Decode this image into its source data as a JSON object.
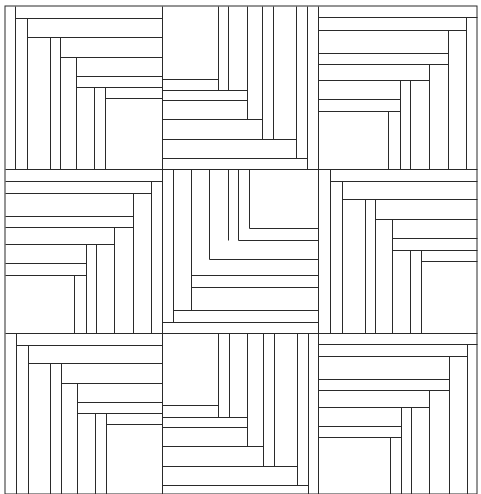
{
  "diagram": {
    "title": "",
    "stroke_color": "#2a2a2a",
    "background_color": "#ffffff",
    "stroke_width": 1,
    "outer_frame": {
      "x": 5,
      "y": 6,
      "w": 472,
      "h": 488
    },
    "block_grid": {
      "cols_x": [
        5,
        162,
        318,
        477
      ],
      "rows_y": [
        6,
        169,
        333,
        494
      ]
    },
    "lines": [
      {
        "x1": 162,
        "y1": 6,
        "x2": 162,
        "y2": 494
      },
      {
        "x1": 318,
        "y1": 6,
        "x2": 318,
        "y2": 494
      },
      {
        "x1": 5,
        "y1": 169,
        "x2": 477,
        "y2": 169
      },
      {
        "x1": 5,
        "y1": 333,
        "x2": 477,
        "y2": 333
      },
      {
        "x1": 15,
        "y1": 6,
        "x2": 15,
        "y2": 169
      },
      {
        "x1": 15,
        "y1": 18,
        "x2": 162,
        "y2": 18
      },
      {
        "x1": 27,
        "y1": 18,
        "x2": 27,
        "y2": 169
      },
      {
        "x1": 27,
        "y1": 37,
        "x2": 162,
        "y2": 37
      },
      {
        "x1": 50,
        "y1": 37,
        "x2": 50,
        "y2": 169
      },
      {
        "x1": 60,
        "y1": 37,
        "x2": 60,
        "y2": 169
      },
      {
        "x1": 60,
        "y1": 57,
        "x2": 162,
        "y2": 57
      },
      {
        "x1": 76,
        "y1": 57,
        "x2": 76,
        "y2": 169
      },
      {
        "x1": 76,
        "y1": 76,
        "x2": 162,
        "y2": 76
      },
      {
        "x1": 76,
        "y1": 87,
        "x2": 162,
        "y2": 87
      },
      {
        "x1": 94,
        "y1": 87,
        "x2": 94,
        "y2": 169
      },
      {
        "x1": 105,
        "y1": 87,
        "x2": 105,
        "y2": 169
      },
      {
        "x1": 105,
        "y1": 98,
        "x2": 162,
        "y2": 98
      },
      {
        "x1": 218,
        "y1": 6,
        "x2": 218,
        "y2": 90
      },
      {
        "x1": 162,
        "y1": 79,
        "x2": 218,
        "y2": 79
      },
      {
        "x1": 228,
        "y1": 6,
        "x2": 228,
        "y2": 90
      },
      {
        "x1": 162,
        "y1": 90,
        "x2": 247,
        "y2": 90
      },
      {
        "x1": 162,
        "y1": 100,
        "x2": 247,
        "y2": 100
      },
      {
        "x1": 247,
        "y1": 6,
        "x2": 247,
        "y2": 119
      },
      {
        "x1": 162,
        "y1": 119,
        "x2": 262,
        "y2": 119
      },
      {
        "x1": 262,
        "y1": 6,
        "x2": 262,
        "y2": 139
      },
      {
        "x1": 273,
        "y1": 6,
        "x2": 273,
        "y2": 139
      },
      {
        "x1": 162,
        "y1": 139,
        "x2": 296,
        "y2": 139
      },
      {
        "x1": 296,
        "y1": 6,
        "x2": 296,
        "y2": 158
      },
      {
        "x1": 162,
        "y1": 158,
        "x2": 307,
        "y2": 158
      },
      {
        "x1": 307,
        "y1": 6,
        "x2": 307,
        "y2": 169
      },
      {
        "x1": 318,
        "y1": 17,
        "x2": 477,
        "y2": 17
      },
      {
        "x1": 466,
        "y1": 17,
        "x2": 466,
        "y2": 169
      },
      {
        "x1": 318,
        "y1": 30,
        "x2": 466,
        "y2": 30
      },
      {
        "x1": 448,
        "y1": 30,
        "x2": 448,
        "y2": 169
      },
      {
        "x1": 318,
        "y1": 53,
        "x2": 448,
        "y2": 53
      },
      {
        "x1": 318,
        "y1": 64,
        "x2": 448,
        "y2": 64
      },
      {
        "x1": 429,
        "y1": 64,
        "x2": 429,
        "y2": 169
      },
      {
        "x1": 318,
        "y1": 80,
        "x2": 429,
        "y2": 80
      },
      {
        "x1": 410,
        "y1": 80,
        "x2": 410,
        "y2": 169
      },
      {
        "x1": 400,
        "y1": 80,
        "x2": 400,
        "y2": 169
      },
      {
        "x1": 318,
        "y1": 99,
        "x2": 400,
        "y2": 99
      },
      {
        "x1": 318,
        "y1": 111,
        "x2": 400,
        "y2": 111
      },
      {
        "x1": 388,
        "y1": 111,
        "x2": 388,
        "y2": 169
      },
      {
        "x1": 5,
        "y1": 181,
        "x2": 162,
        "y2": 181
      },
      {
        "x1": 151,
        "y1": 181,
        "x2": 151,
        "y2": 333
      },
      {
        "x1": 5,
        "y1": 193,
        "x2": 151,
        "y2": 193
      },
      {
        "x1": 133,
        "y1": 193,
        "x2": 133,
        "y2": 333
      },
      {
        "x1": 5,
        "y1": 216,
        "x2": 133,
        "y2": 216
      },
      {
        "x1": 5,
        "y1": 227,
        "x2": 133,
        "y2": 227
      },
      {
        "x1": 114,
        "y1": 227,
        "x2": 114,
        "y2": 333
      },
      {
        "x1": 5,
        "y1": 244,
        "x2": 114,
        "y2": 244
      },
      {
        "x1": 96,
        "y1": 244,
        "x2": 96,
        "y2": 333
      },
      {
        "x1": 86,
        "y1": 244,
        "x2": 86,
        "y2": 333
      },
      {
        "x1": 5,
        "y1": 263,
        "x2": 86,
        "y2": 263
      },
      {
        "x1": 5,
        "y1": 275,
        "x2": 86,
        "y2": 275
      },
      {
        "x1": 74,
        "y1": 275,
        "x2": 74,
        "y2": 333
      },
      {
        "x1": 173,
        "y1": 169,
        "x2": 173,
        "y2": 322
      },
      {
        "x1": 191,
        "y1": 169,
        "x2": 191,
        "y2": 310
      },
      {
        "x1": 209,
        "y1": 169,
        "x2": 209,
        "y2": 259
      },
      {
        "x1": 228,
        "y1": 169,
        "x2": 228,
        "y2": 240
      },
      {
        "x1": 238,
        "y1": 169,
        "x2": 238,
        "y2": 240
      },
      {
        "x1": 249,
        "y1": 169,
        "x2": 249,
        "y2": 228
      },
      {
        "x1": 249,
        "y1": 228,
        "x2": 318,
        "y2": 228
      },
      {
        "x1": 238,
        "y1": 240,
        "x2": 318,
        "y2": 240
      },
      {
        "x1": 209,
        "y1": 259,
        "x2": 318,
        "y2": 259
      },
      {
        "x1": 191,
        "y1": 275,
        "x2": 318,
        "y2": 275
      },
      {
        "x1": 191,
        "y1": 287,
        "x2": 318,
        "y2": 287
      },
      {
        "x1": 173,
        "y1": 310,
        "x2": 318,
        "y2": 310
      },
      {
        "x1": 162,
        "y1": 322,
        "x2": 318,
        "y2": 322
      },
      {
        "x1": 330,
        "y1": 169,
        "x2": 330,
        "y2": 333
      },
      {
        "x1": 330,
        "y1": 181,
        "x2": 477,
        "y2": 181
      },
      {
        "x1": 342,
        "y1": 181,
        "x2": 342,
        "y2": 333
      },
      {
        "x1": 342,
        "y1": 199,
        "x2": 477,
        "y2": 199
      },
      {
        "x1": 365,
        "y1": 199,
        "x2": 365,
        "y2": 333
      },
      {
        "x1": 375,
        "y1": 199,
        "x2": 375,
        "y2": 333
      },
      {
        "x1": 375,
        "y1": 219,
        "x2": 477,
        "y2": 219
      },
      {
        "x1": 392,
        "y1": 219,
        "x2": 392,
        "y2": 333
      },
      {
        "x1": 392,
        "y1": 238,
        "x2": 477,
        "y2": 238
      },
      {
        "x1": 392,
        "y1": 250,
        "x2": 477,
        "y2": 250
      },
      {
        "x1": 410,
        "y1": 250,
        "x2": 410,
        "y2": 333
      },
      {
        "x1": 421,
        "y1": 250,
        "x2": 421,
        "y2": 333
      },
      {
        "x1": 421,
        "y1": 261,
        "x2": 477,
        "y2": 261
      },
      {
        "x1": 16,
        "y1": 333,
        "x2": 16,
        "y2": 494
      },
      {
        "x1": 16,
        "y1": 345,
        "x2": 162,
        "y2": 345
      },
      {
        "x1": 28,
        "y1": 345,
        "x2": 28,
        "y2": 494
      },
      {
        "x1": 28,
        "y1": 363,
        "x2": 162,
        "y2": 363
      },
      {
        "x1": 50,
        "y1": 363,
        "x2": 50,
        "y2": 494
      },
      {
        "x1": 61,
        "y1": 363,
        "x2": 61,
        "y2": 494
      },
      {
        "x1": 61,
        "y1": 383,
        "x2": 162,
        "y2": 383
      },
      {
        "x1": 77,
        "y1": 383,
        "x2": 77,
        "y2": 494
      },
      {
        "x1": 77,
        "y1": 402,
        "x2": 162,
        "y2": 402
      },
      {
        "x1": 77,
        "y1": 413,
        "x2": 162,
        "y2": 413
      },
      {
        "x1": 95,
        "y1": 413,
        "x2": 95,
        "y2": 494
      },
      {
        "x1": 106,
        "y1": 413,
        "x2": 106,
        "y2": 494
      },
      {
        "x1": 106,
        "y1": 424,
        "x2": 162,
        "y2": 424
      },
      {
        "x1": 218,
        "y1": 333,
        "x2": 218,
        "y2": 417
      },
      {
        "x1": 162,
        "y1": 405,
        "x2": 218,
        "y2": 405
      },
      {
        "x1": 229,
        "y1": 333,
        "x2": 229,
        "y2": 417
      },
      {
        "x1": 162,
        "y1": 417,
        "x2": 247,
        "y2": 417
      },
      {
        "x1": 162,
        "y1": 427,
        "x2": 247,
        "y2": 427
      },
      {
        "x1": 247,
        "y1": 333,
        "x2": 247,
        "y2": 446
      },
      {
        "x1": 162,
        "y1": 446,
        "x2": 263,
        "y2": 446
      },
      {
        "x1": 263,
        "y1": 333,
        "x2": 263,
        "y2": 466
      },
      {
        "x1": 274,
        "y1": 333,
        "x2": 274,
        "y2": 466
      },
      {
        "x1": 162,
        "y1": 466,
        "x2": 297,
        "y2": 466
      },
      {
        "x1": 297,
        "y1": 333,
        "x2": 297,
        "y2": 485
      },
      {
        "x1": 162,
        "y1": 485,
        "x2": 308,
        "y2": 485
      },
      {
        "x1": 308,
        "y1": 333,
        "x2": 308,
        "y2": 494
      },
      {
        "x1": 318,
        "y1": 344,
        "x2": 477,
        "y2": 344
      },
      {
        "x1": 467,
        "y1": 344,
        "x2": 467,
        "y2": 494
      },
      {
        "x1": 318,
        "y1": 356,
        "x2": 467,
        "y2": 356
      },
      {
        "x1": 449,
        "y1": 356,
        "x2": 449,
        "y2": 494
      },
      {
        "x1": 318,
        "y1": 379,
        "x2": 449,
        "y2": 379
      },
      {
        "x1": 318,
        "y1": 390,
        "x2": 449,
        "y2": 390
      },
      {
        "x1": 429,
        "y1": 390,
        "x2": 429,
        "y2": 494
      },
      {
        "x1": 318,
        "y1": 407,
        "x2": 429,
        "y2": 407
      },
      {
        "x1": 411,
        "y1": 407,
        "x2": 411,
        "y2": 494
      },
      {
        "x1": 401,
        "y1": 407,
        "x2": 401,
        "y2": 494
      },
      {
        "x1": 318,
        "y1": 426,
        "x2": 401,
        "y2": 426
      },
      {
        "x1": 318,
        "y1": 437,
        "x2": 401,
        "y2": 437
      },
      {
        "x1": 390,
        "y1": 437,
        "x2": 390,
        "y2": 494
      }
    ]
  }
}
